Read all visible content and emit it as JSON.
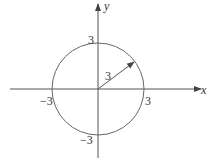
{
  "diagram": {
    "axes": {
      "x_label": "x",
      "y_label": "y"
    },
    "circle": {
      "center": [
        0,
        0
      ],
      "radius": 3
    },
    "radius_label": "3",
    "tick_labels": {
      "x_pos": "3",
      "x_neg": "−3",
      "y_pos": "3",
      "y_neg": "−3"
    },
    "colors": {
      "stroke": "#555555",
      "text": "#333333"
    }
  }
}
